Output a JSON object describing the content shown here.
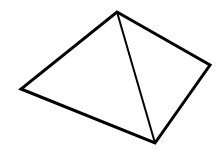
{
  "diagram": {
    "type": "geometric-line-drawing",
    "background_color": "#ffffff",
    "stroke_color": "#000000",
    "outline_stroke_width": 3,
    "diagonal_stroke_width": 2,
    "vertices": {
      "top": [
        117,
        12
      ],
      "right": [
        210,
        65
      ],
      "bottom": [
        155,
        143
      ],
      "left": [
        21,
        89
      ]
    },
    "outline_order": [
      "top",
      "right",
      "bottom",
      "left"
    ],
    "diagonal": [
      "top",
      "bottom"
    ]
  }
}
